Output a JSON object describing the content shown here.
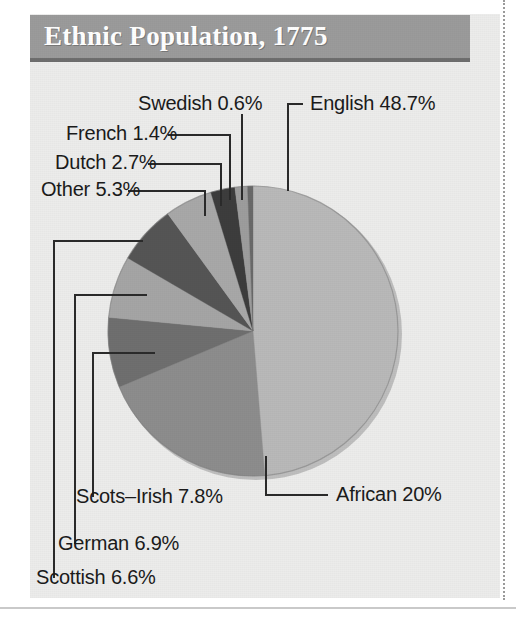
{
  "figure": {
    "title": "Ethnic Population, 1775",
    "background_color": "#ececeb",
    "title_bar_color": "#9b9b9b",
    "title_text_color": "#ffffff"
  },
  "chart_data": {
    "type": "pie",
    "title": "Ethnic Population, 1775",
    "xlabel": "",
    "ylabel": "",
    "legend_position": "none",
    "grid": false,
    "labels_format": "name + percent, external with leader lines",
    "categories": [
      "English",
      "African",
      "Scots-Irish",
      "German",
      "Scottish",
      "Other",
      "Dutch",
      "French",
      "Swedish"
    ],
    "values": [
      48.7,
      20,
      7.8,
      6.9,
      6.6,
      5.3,
      2.7,
      1.4,
      0.6
    ],
    "slices": [
      {
        "name": "English",
        "value": 48.7,
        "label": "English 48.7%",
        "color": "#b9b9b9"
      },
      {
        "name": "African",
        "value": 20,
        "label": "African 20%",
        "color": "#8d8d8d"
      },
      {
        "name": "Scots-Irish",
        "value": 7.8,
        "label": "Scots–Irish 7.8%",
        "color": "#6f6f6f"
      },
      {
        "name": "German",
        "value": 6.9,
        "label": "German 6.9%",
        "color": "#a5a5a5"
      },
      {
        "name": "Scottish",
        "value": 6.6,
        "label": "Scottish 6.6%",
        "color": "#555555"
      },
      {
        "name": "Other",
        "value": 5.3,
        "label": "Other 5.3%",
        "color": "#a8a8a8"
      },
      {
        "name": "Dutch",
        "value": 2.7,
        "label": "Dutch 2.7%",
        "color": "#3d3d3d"
      },
      {
        "name": "French",
        "value": 1.4,
        "label": "French 1.4%",
        "color": "#9d9d9d"
      },
      {
        "name": "Swedish",
        "value": 0.6,
        "label": "Swedish 0.6%",
        "color": "#6a6a6a"
      }
    ],
    "total": 100.0
  },
  "labels": {
    "swedish": "Swedish 0.6%",
    "french": "French 1.4%",
    "dutch": "Dutch 2.7%",
    "other": "Other 5.3%",
    "english": "English 48.7%",
    "african": "African 20%",
    "scots_irish": "Scots–Irish 7.8%",
    "german": "German 6.9%",
    "scottish": "Scottish 6.6%"
  }
}
